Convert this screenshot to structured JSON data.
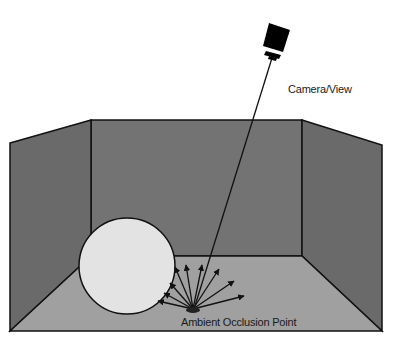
{
  "labels": {
    "camera": "Camera/View",
    "point": "Ambient Occlusion Point"
  },
  "colors": {
    "background": "#ffffff",
    "walls": "#6b6b6b",
    "back_wall": "#717171",
    "floor": "#9e9e9e",
    "sphere": "#e2e2e2",
    "stroke": "#111111"
  },
  "scene": {
    "elements": [
      "room-left-wall",
      "room-back-wall",
      "room-right-wall",
      "floor",
      "sphere",
      "camera",
      "view-ray",
      "hemisphere-sample-rays",
      "occlusion-point"
    ],
    "sample_ray_count": 10
  }
}
